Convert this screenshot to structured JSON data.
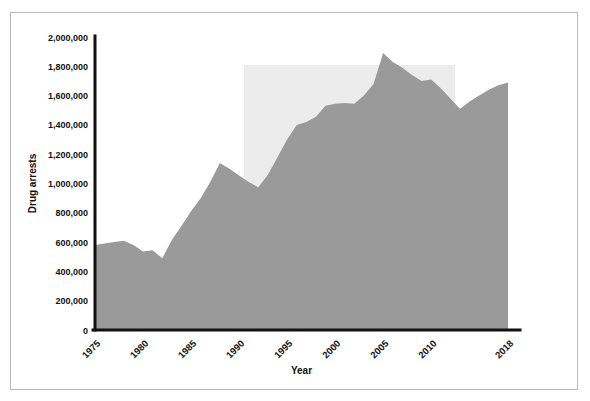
{
  "chart_data": {
    "type": "area",
    "title": "",
    "xlabel": "Year",
    "ylabel": "Drug arrests",
    "xlim": [
      1975,
      2018
    ],
    "ylim": [
      0,
      2000000
    ],
    "grid": false,
    "legend": null,
    "series_color": "#9a9a9a",
    "highlight_band_color": "#ececec",
    "axis_color": "#111111",
    "frame_color": "#b9b9b9",
    "x_tick_labels": [
      "1975",
      "1980",
      "1985",
      "1990",
      "1995",
      "2000",
      "2005",
      "2010",
      "2018"
    ],
    "x_tick_values": [
      1975,
      1980,
      1985,
      1990,
      1995,
      2000,
      2005,
      2010,
      2018
    ],
    "y_tick_labels": [
      "0",
      "200,000",
      "400,000",
      "600,000",
      "800,000",
      "1,000,000",
      "1,200,000",
      "1,400,000",
      "1,600,000",
      "1,800,000",
      "2,000,000"
    ],
    "y_tick_values": [
      0,
      200000,
      400000,
      600000,
      800000,
      1000000,
      1200000,
      1400000,
      1600000,
      1800000,
      2000000
    ],
    "highlight_band": {
      "x0": 1990.5,
      "x1": 2012.5,
      "y0": 0,
      "y1": 1810000
    },
    "x": [
      1975,
      1976,
      1977,
      1978,
      1979,
      1980,
      1981,
      1982,
      1983,
      1984,
      1985,
      1986,
      1987,
      1988,
      1989,
      1990,
      1991,
      1992,
      1993,
      1994,
      1995,
      1996,
      1997,
      1998,
      1999,
      2000,
      2001,
      2002,
      2003,
      2004,
      2005,
      2006,
      2007,
      2008,
      2009,
      2010,
      2011,
      2012,
      2013,
      2014,
      2015,
      2016,
      2017,
      2018
    ],
    "values": [
      580000,
      590000,
      600000,
      610000,
      580000,
      535000,
      545000,
      490000,
      615000,
      710000,
      810000,
      900000,
      1010000,
      1140000,
      1100000,
      1055000,
      1010000,
      975000,
      1060000,
      1180000,
      1300000,
      1400000,
      1420000,
      1455000,
      1530000,
      1545000,
      1550000,
      1545000,
      1600000,
      1680000,
      1890000,
      1830000,
      1790000,
      1740000,
      1700000,
      1710000,
      1650000,
      1580000,
      1510000,
      1560000,
      1600000,
      1640000,
      1670000,
      1690000
    ],
    "annotations": [
      {
        "text": "shaded period band",
        "x0": 1990.5,
        "x1": 2012.5
      }
    ]
  }
}
